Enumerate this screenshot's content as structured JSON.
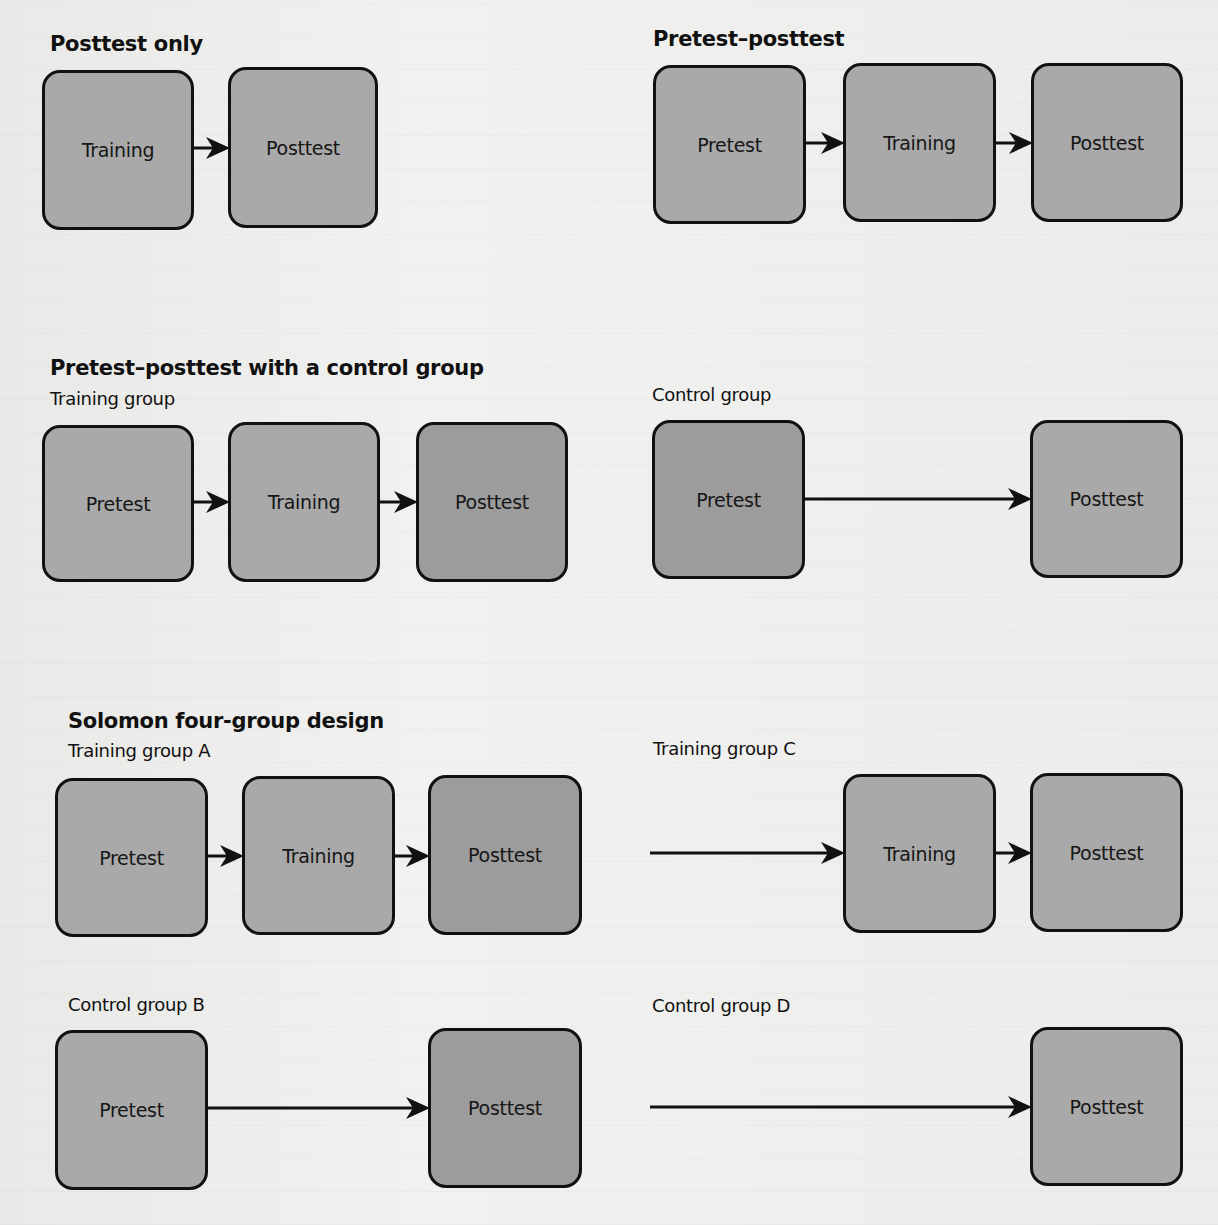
{
  "figure": {
    "panels": [
      {
        "id": "posttest-only",
        "title": "Posttest only",
        "title_pos": [
          50,
          34
        ],
        "groups": [
          {
            "label": "",
            "boxes": [
              {
                "label": "Training",
                "rect": [
                  42,
                  70,
                  152,
                  160
                ]
              },
              {
                "label": "Posttest",
                "rect": [
                  228,
                  67,
                  150,
                  161
                ]
              }
            ],
            "arrows": [
              {
                "from": [
                  194,
                  148
                ],
                "to": [
                  228,
                  148
                ]
              }
            ]
          }
        ]
      },
      {
        "id": "pretest-posttest",
        "title": "Pretest–posttest",
        "title_pos": [
          653,
          29
        ],
        "groups": [
          {
            "label": "",
            "boxes": [
              {
                "label": "Pretest",
                "rect": [
                  653,
                  65,
                  153,
                  159
                ]
              },
              {
                "label": "Training",
                "rect": [
                  843,
                  63,
                  153,
                  159
                ]
              },
              {
                "label": "Posttest",
                "rect": [
                  1031,
                  63,
                  152,
                  159
                ]
              }
            ],
            "arrows": [
              {
                "from": [
                  806,
                  143
                ],
                "to": [
                  843,
                  143
                ]
              },
              {
                "from": [
                  996,
                  143
                ],
                "to": [
                  1031,
                  143
                ]
              }
            ]
          }
        ]
      },
      {
        "id": "pretest-posttest-control",
        "title": "Pretest–posttest with a control group",
        "title_pos": [
          50,
          358
        ],
        "groups": [
          {
            "label": "Training group",
            "label_pos": [
              50,
              390
            ],
            "boxes": [
              {
                "label": "Pretest",
                "rect": [
                  42,
                  425,
                  152,
                  157
                ]
              },
              {
                "label": "Training",
                "rect": [
                  228,
                  422,
                  152,
                  160
                ]
              },
              {
                "label": "Posttest",
                "rect": [
                  416,
                  422,
                  152,
                  160
                ],
                "dark": true
              }
            ],
            "arrows": [
              {
                "from": [
                  194,
                  502
                ],
                "to": [
                  228,
                  502
                ]
              },
              {
                "from": [
                  380,
                  502
                ],
                "to": [
                  416,
                  502
                ]
              }
            ]
          },
          {
            "label": "Control group",
            "label_pos": [
              652,
              386
            ],
            "boxes": [
              {
                "label": "Pretest",
                "rect": [
                  652,
                  420,
                  153,
                  159
                ],
                "dark": true
              },
              {
                "label": "Posttest",
                "rect": [
                  1030,
                  420,
                  153,
                  158
                ]
              }
            ],
            "arrows": [
              {
                "from": [
                  805,
                  499
                ],
                "to": [
                  1030,
                  499
                ]
              }
            ]
          }
        ]
      },
      {
        "id": "solomon-four-group",
        "title": "Solomon four-group design",
        "title_pos": [
          68,
          711
        ],
        "groups": [
          {
            "label": "Training group A",
            "label_pos": [
              68,
              742
            ],
            "boxes": [
              {
                "label": "Pretest",
                "rect": [
                  55,
                  778,
                  153,
                  159
                ]
              },
              {
                "label": "Training",
                "rect": [
                  242,
                  776,
                  153,
                  159
                ]
              },
              {
                "label": "Posttest",
                "rect": [
                  428,
                  775,
                  154,
                  160
                ],
                "dark": true
              }
            ],
            "arrows": [
              {
                "from": [
                  208,
                  856
                ],
                "to": [
                  242,
                  856
                ]
              },
              {
                "from": [
                  395,
                  856
                ],
                "to": [
                  428,
                  856
                ]
              }
            ]
          },
          {
            "label": "Training group C",
            "label_pos": [
              653,
              740
            ],
            "boxes": [
              {
                "label": "Training",
                "rect": [
                  843,
                  774,
                  153,
                  159
                ]
              },
              {
                "label": "Posttest",
                "rect": [
                  1030,
                  773,
                  153,
                  159
                ]
              }
            ],
            "arrows": [
              {
                "from": [
                  650,
                  853
                ],
                "to": [
                  843,
                  853
                ]
              },
              {
                "from": [
                  996,
                  853
                ],
                "to": [
                  1030,
                  853
                ]
              }
            ]
          },
          {
            "label": "Control group B",
            "label_pos": [
              68,
              996
            ],
            "boxes": [
              {
                "label": "Pretest",
                "rect": [
                  55,
                  1030,
                  153,
                  160
                ]
              },
              {
                "label": "Posttest",
                "rect": [
                  428,
                  1028,
                  154,
                  160
                ],
                "dark": true
              }
            ],
            "arrows": [
              {
                "from": [
                  208,
                  1108
                ],
                "to": [
                  428,
                  1108
                ]
              }
            ]
          },
          {
            "label": "Control group D",
            "label_pos": [
              652,
              997
            ],
            "boxes": [
              {
                "label": "Posttest",
                "rect": [
                  1030,
                  1027,
                  153,
                  159
                ]
              }
            ],
            "arrows": [
              {
                "from": [
                  650,
                  1107
                ],
                "to": [
                  1030,
                  1107
                ]
              }
            ]
          }
        ]
      }
    ]
  },
  "colors": {
    "box_fill": "#a9a9a9",
    "box_fill_dark": "#9c9c9c",
    "box_border": "#111111",
    "arrow": "#111111",
    "background": "#eeeeec"
  }
}
